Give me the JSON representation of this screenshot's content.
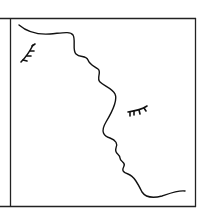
{
  "figure": {
    "stroke_color": "#111111",
    "background": "#ffffff",
    "elements": [
      "frame",
      "face-profile-line",
      "left-eye-lashes",
      "right-eye-lashes"
    ]
  }
}
